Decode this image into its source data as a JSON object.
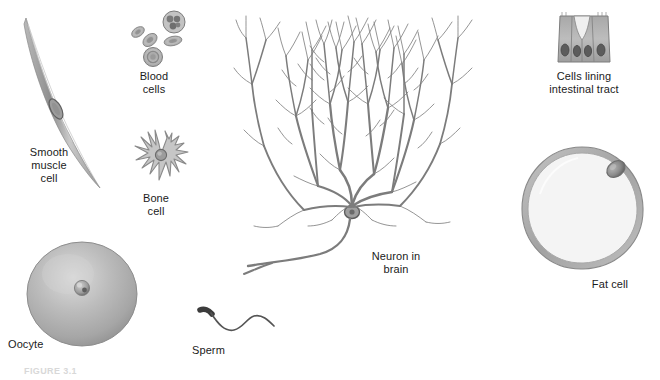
{
  "figure": {
    "background_color": "#ffffff",
    "ink_color": "#6e6e6e",
    "text_color": "#1b1b1b",
    "caption_partial": "FIGURE 3.1"
  },
  "specimens": [
    {
      "id": "smooth-muscle",
      "label": "Smooth\nmuscle\ncell",
      "icon_name": "smooth-muscle-cell-illustration",
      "description": "elongated spindle-shaped cell with central nucleus"
    },
    {
      "id": "blood-cells",
      "label": "Blood\ncells",
      "icon_name": "blood-cells-illustration",
      "description": "cluster of erythrocytes and one lobed-nucleus leukocyte"
    },
    {
      "id": "bone-cell",
      "label": "Bone\ncell",
      "icon_name": "bone-cell-illustration",
      "description": "star-shaped osteocyte with radiating processes"
    },
    {
      "id": "oocyte",
      "label": "Oocyte",
      "icon_name": "oocyte-illustration",
      "description": "large shaded sphere with small central nucleus"
    },
    {
      "id": "neuron",
      "label": "Neuron in\nbrain",
      "icon_name": "neuron-illustration",
      "description": "Purkinje cell with extensive dendritic arbor and descending axon"
    },
    {
      "id": "sperm",
      "label": "Sperm",
      "icon_name": "sperm-illustration",
      "description": "small dark head with long wavy flagellum"
    },
    {
      "id": "intestinal",
      "label": "Cells lining\nintestinal tract",
      "icon_name": "intestinal-lining-cells-illustration",
      "description": "three columnar epithelial cells with basal nuclei and a goblet cell"
    },
    {
      "id": "fat-cell",
      "label": "Fat cell",
      "icon_name": "fat-cell-illustration",
      "description": "large rounded lipid droplet with thin rim and peripheral nucleus"
    }
  ]
}
